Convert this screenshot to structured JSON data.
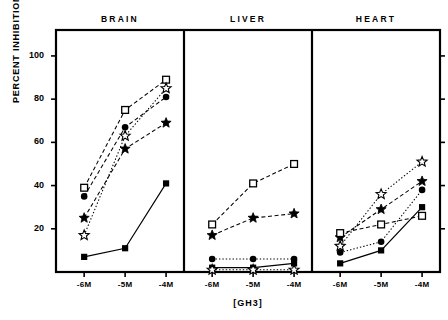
{
  "chart_data": {
    "type": "line",
    "title": "",
    "xlabel": "[GH3]",
    "ylabel": "PERCENT INHIBITION",
    "categories": [
      "-6M",
      "-5M",
      "-4M"
    ],
    "yticks": [
      20,
      40,
      60,
      80,
      100
    ],
    "ylim": [
      0,
      112
    ],
    "grid": false,
    "legend": "none",
    "panels": [
      {
        "name": "BRAIN",
        "series": [
          {
            "name": "open-square",
            "marker": "open-square",
            "line": "dashed",
            "values": [
              39,
              75,
              89
            ]
          },
          {
            "name": "open-star",
            "marker": "open-star",
            "line": "dotted",
            "values": [
              17,
              63,
              85
            ]
          },
          {
            "name": "filled-circle",
            "marker": "filled-circle",
            "line": "dashed",
            "values": [
              35,
              67,
              81
            ]
          },
          {
            "name": "filled-star",
            "marker": "filled-star",
            "line": "dashed",
            "values": [
              25,
              57,
              69
            ]
          },
          {
            "name": "filled-square",
            "marker": "filled-square",
            "line": "solid",
            "values": [
              7,
              11,
              41
            ]
          }
        ]
      },
      {
        "name": "LIVER",
        "series": [
          {
            "name": "open-square",
            "marker": "open-square",
            "line": "dashed",
            "values": [
              22,
              41,
              50
            ]
          },
          {
            "name": "filled-star",
            "marker": "filled-star",
            "line": "dashed",
            "values": [
              17,
              25,
              27
            ]
          },
          {
            "name": "filled-circle",
            "marker": "filled-circle",
            "line": "dotted",
            "values": [
              6,
              6,
              6
            ]
          },
          {
            "name": "filled-square",
            "marker": "filled-square",
            "line": "solid",
            "values": [
              2,
              2,
              4
            ]
          },
          {
            "name": "open-star",
            "marker": "open-star",
            "line": "dotted",
            "values": [
              1,
              1,
              1
            ]
          }
        ]
      },
      {
        "name": "HEART",
        "series": [
          {
            "name": "open-star",
            "marker": "open-star",
            "line": "dotted",
            "values": [
              12,
              36,
              51
            ]
          },
          {
            "name": "filled-star",
            "marker": "filled-star",
            "line": "dashed",
            "values": [
              16,
              29,
              42
            ]
          },
          {
            "name": "filled-circle",
            "marker": "filled-circle",
            "line": "dotted",
            "values": [
              9,
              14,
              38
            ]
          },
          {
            "name": "filled-square",
            "marker": "filled-square",
            "line": "solid",
            "values": [
              4,
              10,
              30
            ]
          },
          {
            "name": "open-square",
            "marker": "open-square",
            "line": "dashed",
            "values": [
              18,
              22,
              26
            ]
          }
        ]
      }
    ]
  }
}
